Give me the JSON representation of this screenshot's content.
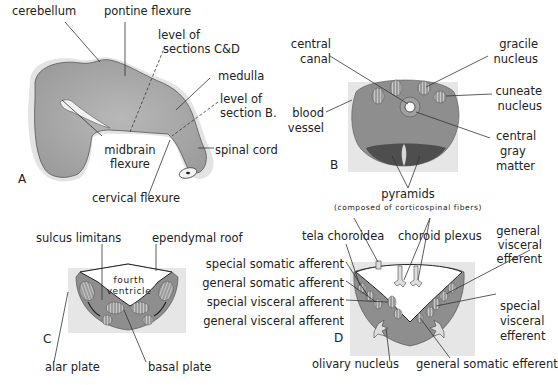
{
  "figure": {
    "panels": {
      "A": {
        "letter": "A",
        "labels": {
          "cerebellum": "cerebellum",
          "pontine_flexure": "pontine flexure",
          "level_cd_1": "level of",
          "level_cd_2": "sections C&D",
          "medulla": "medulla",
          "level_b_1": "level of",
          "level_b_2": "section B.",
          "spinal_cord": "spinal cord",
          "midbrain_1": "midbrain",
          "midbrain_2": "flexure",
          "cervical_flexure": "cervical flexure"
        }
      },
      "B": {
        "letter": "B",
        "labels": {
          "central_canal_1": "central",
          "central_canal_2": "canal",
          "gracile_1": "gracile",
          "gracile_2": "nucleus",
          "cuneate_1": "cuneate",
          "cuneate_2": "nucleus",
          "blood_vessel_1": "blood",
          "blood_vessel_2": "vessel",
          "central_gray_1": "central",
          "central_gray_2": "gray",
          "central_gray_3": "matter",
          "pyramids": "pyramids",
          "pyramids_note": "(composed of corticospinal fibers)"
        }
      },
      "C": {
        "letter": "C",
        "labels": {
          "sulcus_limitans": "sulcus limitans",
          "ependymal_roof": "ependymal roof",
          "fourth_1": "fourth",
          "fourth_2": "ventricle",
          "alar_plate": "alar plate",
          "basal_plate": "basal plate"
        }
      },
      "D": {
        "letter": "D",
        "labels": {
          "tela_choroidea": "tela choroidea",
          "choroid_plexus": "choroid plexus",
          "gve_1": "general",
          "gve_2": "visceral",
          "gve_3": "efferent",
          "ssa": "special somatic afferent",
          "gsa": "general somatic afferent",
          "sva": "special visceral afferent",
          "gva": "general visceral afferent",
          "sve_1": "special",
          "sve_2": "visceral",
          "sve_3": "efferent",
          "olivary": "olivary nucleus",
          "gse": "general somatic efferent"
        }
      }
    },
    "colors": {
      "tissue_light": "#a9a9a9",
      "tissue_mid": "#8e8e8e",
      "tissue_dark": "#5a5a5a",
      "background_tint": "#e6e6e6",
      "line": "#333333"
    }
  }
}
